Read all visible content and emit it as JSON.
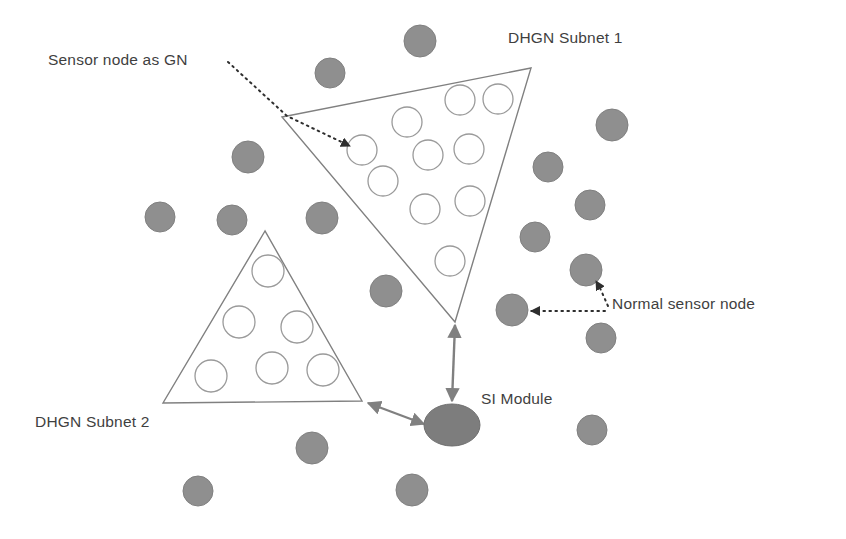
{
  "diagram": {
    "labels": {
      "sensor_node_as_gn": "Sensor node as GN",
      "dhgn_subnet_1": "DHGN Subnet 1",
      "dhgn_subnet_2": "DHGN Subnet 2",
      "si_module": "SI Module",
      "normal_sensor_node": "Normal sensor node"
    },
    "colors": {
      "normal_sensor_node_fill": "#8f8f8f",
      "normal_sensor_node_stroke": "#7d7d7d",
      "si_module_fill": "#7d7d7d",
      "gn_node_fill": "#ffffff",
      "gn_node_stroke": "#9a9a9a",
      "subnet_outline": "#808080",
      "annotation_line": "#3a3a3a",
      "connector_arrow": "#808080",
      "label_text": "#3f3f3f",
      "background": "#ffffff"
    },
    "shapes": {
      "subnet_1": {
        "name": "DHGN Subnet 1",
        "type": "triangle",
        "points": "282,117 531,68 455,322",
        "gn_nodes": [
          {
            "cx": 362,
            "cy": 150,
            "r": 15
          },
          {
            "cx": 407,
            "cy": 122,
            "r": 15
          },
          {
            "cx": 460,
            "cy": 100,
            "r": 15
          },
          {
            "cx": 498,
            "cy": 99,
            "r": 15
          },
          {
            "cx": 383,
            "cy": 181,
            "r": 15
          },
          {
            "cx": 428,
            "cy": 155,
            "r": 15
          },
          {
            "cx": 469,
            "cy": 149,
            "r": 15
          },
          {
            "cx": 425,
            "cy": 209,
            "r": 15
          },
          {
            "cx": 470,
            "cy": 201,
            "r": 15
          },
          {
            "cx": 450,
            "cy": 261,
            "r": 15
          }
        ]
      },
      "subnet_2": {
        "name": "DHGN Subnet 2",
        "type": "triangle",
        "points": "265,231 163,403 362,401",
        "gn_nodes": [
          {
            "cx": 268,
            "cy": 271,
            "r": 16
          },
          {
            "cx": 239,
            "cy": 322,
            "r": 16
          },
          {
            "cx": 297,
            "cy": 327,
            "r": 16
          },
          {
            "cx": 211,
            "cy": 376,
            "r": 16
          },
          {
            "cx": 272,
            "cy": 368,
            "r": 16
          },
          {
            "cx": 323,
            "cy": 370,
            "r": 16
          }
        ]
      },
      "si_module": {
        "cx": 452,
        "cy": 425,
        "rx": 28,
        "ry": 21
      },
      "normal_sensor_nodes": [
        {
          "cx": 420,
          "cy": 41,
          "r": 16
        },
        {
          "cx": 330,
          "cy": 73,
          "r": 15
        },
        {
          "cx": 248,
          "cy": 157,
          "r": 16
        },
        {
          "cx": 160,
          "cy": 217,
          "r": 15
        },
        {
          "cx": 232,
          "cy": 220,
          "r": 15
        },
        {
          "cx": 322,
          "cy": 218,
          "r": 16
        },
        {
          "cx": 612,
          "cy": 125,
          "r": 16
        },
        {
          "cx": 548,
          "cy": 167,
          "r": 15
        },
        {
          "cx": 590,
          "cy": 205,
          "r": 15
        },
        {
          "cx": 535,
          "cy": 237,
          "r": 15
        },
        {
          "cx": 386,
          "cy": 291,
          "r": 16
        },
        {
          "cx": 586,
          "cy": 270,
          "r": 16
        },
        {
          "cx": 512,
          "cy": 310,
          "r": 16
        },
        {
          "cx": 601,
          "cy": 338,
          "r": 15
        },
        {
          "cx": 312,
          "cy": 448,
          "r": 16
        },
        {
          "cx": 592,
          "cy": 430,
          "r": 15
        },
        {
          "cx": 198,
          "cy": 491,
          "r": 15
        },
        {
          "cx": 412,
          "cy": 490,
          "r": 16
        }
      ]
    },
    "connectors": [
      {
        "name": "subnet-1-to-si-module",
        "type": "double-arrow",
        "from": [
          455,
          322
        ],
        "to": [
          452,
          402
        ]
      },
      {
        "name": "subnet-2-to-si-module",
        "type": "double-arrow",
        "from": [
          365,
          402
        ],
        "to": [
          426,
          424
        ]
      }
    ],
    "annotations": [
      {
        "name": "sensor-node-as-gn-leader",
        "style": "dotted-arrow",
        "from": [
          228,
          62
        ],
        "bend": [
          287,
          116
        ],
        "to": [
          352,
          147
        ]
      },
      {
        "name": "normal-sensor-node-leader-upper",
        "style": "dotted-arrow",
        "from": [
          606,
          307
        ],
        "to": [
          597,
          283
        ]
      },
      {
        "name": "normal-sensor-node-leader-lower",
        "style": "dotted-arrow",
        "from": [
          604,
          311
        ],
        "to": [
          528,
          311
        ]
      }
    ]
  }
}
